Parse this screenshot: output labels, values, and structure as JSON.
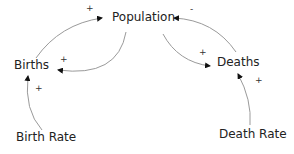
{
  "diagram": {
    "type": "causal-loop",
    "nodes": {
      "population": "Population",
      "births": "Births",
      "deaths": "Deaths",
      "birth_rate": "Birth Rate",
      "death_rate": "Death Rate"
    },
    "links": [
      {
        "from": "Births",
        "to": "Population",
        "polarity": "+"
      },
      {
        "from": "Population",
        "to": "Births",
        "polarity": "+"
      },
      {
        "from": "Deaths",
        "to": "Population",
        "polarity": "-"
      },
      {
        "from": "Population",
        "to": "Deaths",
        "polarity": "+"
      },
      {
        "from": "Birth Rate",
        "to": "Births",
        "polarity": "+"
      },
      {
        "from": "Death Rate",
        "to": "Deaths",
        "polarity": "+"
      }
    ],
    "polarities": {
      "births_to_population": "+",
      "population_to_births": "+",
      "deaths_to_population": "-",
      "population_to_deaths": "+",
      "birthrate_to_births": "+",
      "deathrate_to_deaths": "+"
    },
    "colors": {
      "arrow": "#9a9a9a",
      "text": "#222222"
    }
  }
}
